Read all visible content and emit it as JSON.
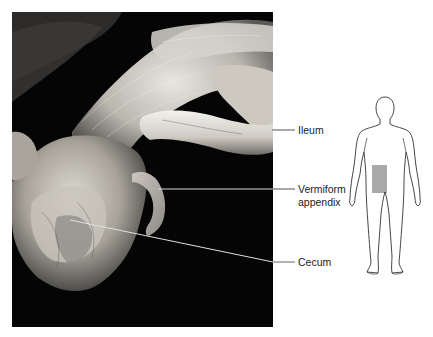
{
  "figure": {
    "photo_description": "Dissected cecum with vermiform appendix and terminal ileum",
    "labels": [
      {
        "id": "ileum",
        "lines": [
          "Ileum"
        ]
      },
      {
        "id": "appendix",
        "lines": [
          "Vermiform",
          "appendix"
        ]
      },
      {
        "id": "cecum",
        "lines": [
          "Cecum"
        ]
      }
    ],
    "orientation_inset": {
      "description": "Anterior body outline with highlighted right lower abdominal region",
      "highlight_color": "#9a9a9a"
    }
  }
}
